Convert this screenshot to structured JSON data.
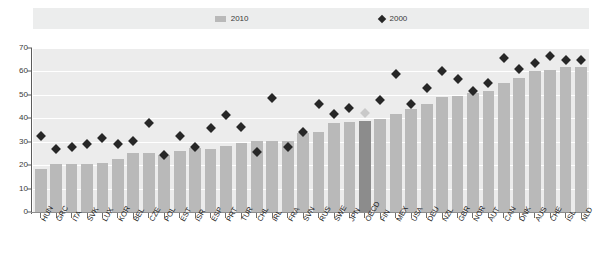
{
  "legend": {
    "items": [
      {
        "label": "2010",
        "marker": "bar-swatch-icon",
        "color": "#b9b9b9"
      },
      {
        "label": "2000",
        "marker": "diamond-icon",
        "color": "#272727"
      }
    ]
  },
  "axis": {
    "y_ticks": [
      "0",
      "10",
      "20",
      "30",
      "40",
      "50",
      "60",
      "70"
    ]
  },
  "chart_data": {
    "type": "bar",
    "title": "",
    "subtitle": "",
    "xlabel": "",
    "ylabel": "",
    "ylim": [
      0,
      70
    ],
    "ytick_step": 10,
    "grid": true,
    "legend_position": "top",
    "highlight_category": "OECD",
    "colors": {
      "bar_2010": "#b9b9b9",
      "bar_2010_highlight": "#8c8c8c",
      "marker_2000": "#272727",
      "marker_2000_highlight": "#c9c9c9",
      "plot_background": "#ececec",
      "gridline": "#ffffff"
    },
    "categories": [
      "HUN",
      "GRC",
      "ITA",
      "SVK",
      "LUX",
      "KOR",
      "BEL",
      "CZE",
      "POL",
      "EST",
      "ISR",
      "ESP",
      "PRT",
      "TUR",
      "CHL",
      "IRL",
      "FRA",
      "SVN",
      "RUS",
      "SWE",
      "JPN",
      "OECD",
      "FIN",
      "MEX",
      "USA",
      "DEU",
      "NZL",
      "GBR",
      "NOR",
      "AUT",
      "CAN",
      "DNK",
      "AUS",
      "CHE",
      "ISL",
      "NLD"
    ],
    "series": [
      {
        "name": "2010",
        "type": "bar",
        "values": [
          18.3,
          20.4,
          20.5,
          20.5,
          21.1,
          22.6,
          25.1,
          25.0,
          24.2,
          26.1,
          27.2,
          27.1,
          28.0,
          29.3,
          30.3,
          30.3,
          30.3,
          33.8,
          34.3,
          37.8,
          38.5,
          38.7,
          39.8,
          41.8,
          44.0,
          46.1,
          48.9,
          49.7,
          51.0,
          51.5,
          55.0,
          57.4,
          60.3,
          60.6,
          61.8,
          61.8
        ]
      },
      {
        "name": "2000",
        "type": "scatter",
        "marker": "diamond",
        "values": [
          32.5,
          26.9,
          27.7,
          28.9,
          31.5,
          29.1,
          30.1,
          38.0,
          24.2,
          32.5,
          27.8,
          35.9,
          41.3,
          36.5,
          25.8,
          48.7,
          27.6,
          34.3,
          45.9,
          41.9,
          44.5,
          42.1,
          48.0,
          58.8,
          46.1,
          53.1,
          60.4,
          56.9,
          51.6,
          55.0,
          65.7,
          60.9,
          63.8,
          66.6,
          65.0,
          65.0
        ]
      }
    ]
  }
}
